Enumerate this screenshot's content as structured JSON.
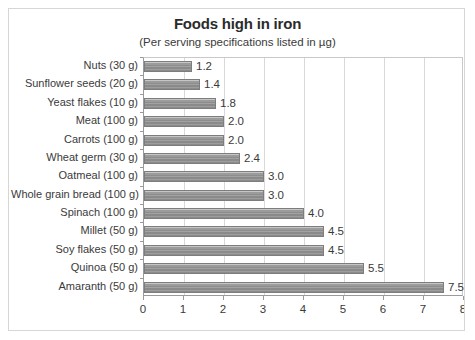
{
  "chart_data": {
    "type": "bar",
    "orientation": "horizontal",
    "title": "Foods high in iron",
    "subtitle": "(Per serving specifications listed in µg)",
    "xlabel": "",
    "ylabel": "",
    "xlim": [
      0,
      8
    ],
    "xticks": [
      "0",
      "1",
      "2",
      "3",
      "4",
      "5",
      "6",
      "7",
      "8"
    ],
    "grid": "vertical",
    "legend": "none",
    "categories": [
      "Nuts (30 g)",
      "Sunflower seeds (20 g)",
      "Yeast flakes (10 g)",
      "Meat (100 g)",
      "Carrots (100 g)",
      "Wheat germ (30 g)",
      "Oatmeal (100 g)",
      "Whole grain bread (100 g)",
      "Spinach (100 g)",
      "Millet (50 g)",
      "Soy flakes (50 g)",
      "Quinoa (50 g)",
      "Amaranth (50 g)"
    ],
    "values": [
      1.2,
      1.4,
      1.8,
      2.0,
      2.0,
      2.4,
      3.0,
      3.0,
      4.0,
      4.5,
      4.5,
      5.5,
      7.5
    ],
    "data_labels": [
      "1.2",
      "1.4",
      "1.8",
      "2.0",
      "2.0",
      "2.4",
      "3.0",
      "3.0",
      "4.0",
      "4.5",
      "4.5",
      "5.5",
      "7.5"
    ],
    "colors": {
      "bar_fill": "#949494",
      "bar_border": "#7d7d7d",
      "text": "#3a3a3a",
      "title": "#2b2b2b",
      "gridline": "#d9d9d9",
      "axis": "#9a9a9a",
      "frame": "#d6d6d6",
      "background": "#ffffff"
    }
  }
}
